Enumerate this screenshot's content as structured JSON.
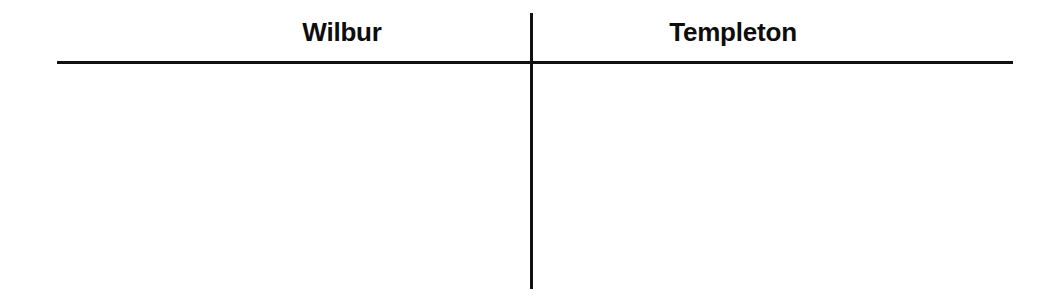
{
  "document": {
    "type": "t-chart",
    "background_color": "#ffffff",
    "ink_color": "#111111"
  },
  "columns": [
    {
      "id": "left",
      "header": "Wilbur",
      "entries": []
    },
    {
      "id": "right",
      "header": "Templeton",
      "entries": []
    }
  ],
  "rules": {
    "horizontal": {
      "name": "header-underline",
      "color": "#111111"
    },
    "vertical": {
      "name": "column-divider",
      "color": "#111111"
    }
  }
}
